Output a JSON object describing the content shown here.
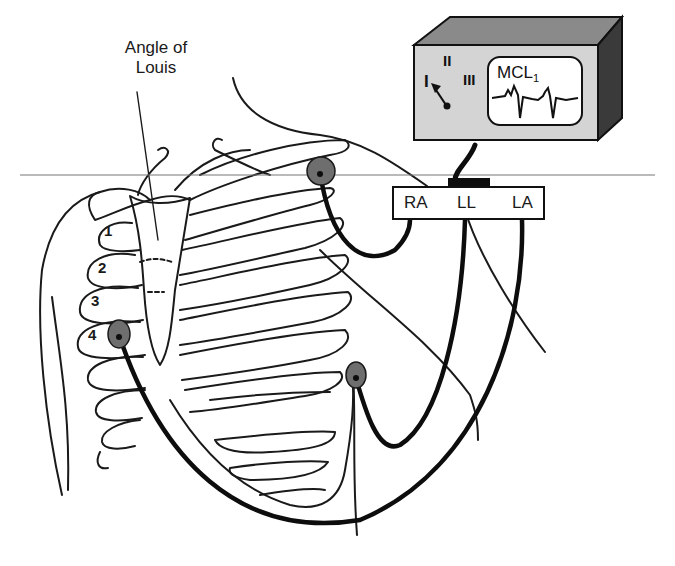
{
  "figure": {
    "annotation_angle_of_louis": "Angle of\nLouis",
    "angle_line1": "Angle of",
    "angle_line2": "Louis"
  },
  "rib_labels": [
    "1",
    "2",
    "3",
    "4"
  ],
  "monitor": {
    "lead_selector": [
      "I",
      "II",
      "III"
    ],
    "screen_label": "MCL",
    "screen_label_subscript": "1",
    "body_color": "#d4d4d4",
    "top_color": "#8a8a8a",
    "side_color": "#3a3a3a"
  },
  "lead_box": {
    "labels": [
      "RA",
      "LL",
      "LA"
    ]
  },
  "electrodes": [
    {
      "name": "RA-electrode",
      "location": "left shoulder below clavicle"
    },
    {
      "name": "LL-electrode",
      "location": "left lower chest"
    },
    {
      "name": "LA-electrode",
      "location": "4th intercostal space right sternal border"
    }
  ],
  "colors": {
    "electrode_fill": "#6e6e6e",
    "wire": "#0d0d0d",
    "line": "#1a1a1a",
    "reference_line": "#777777"
  }
}
